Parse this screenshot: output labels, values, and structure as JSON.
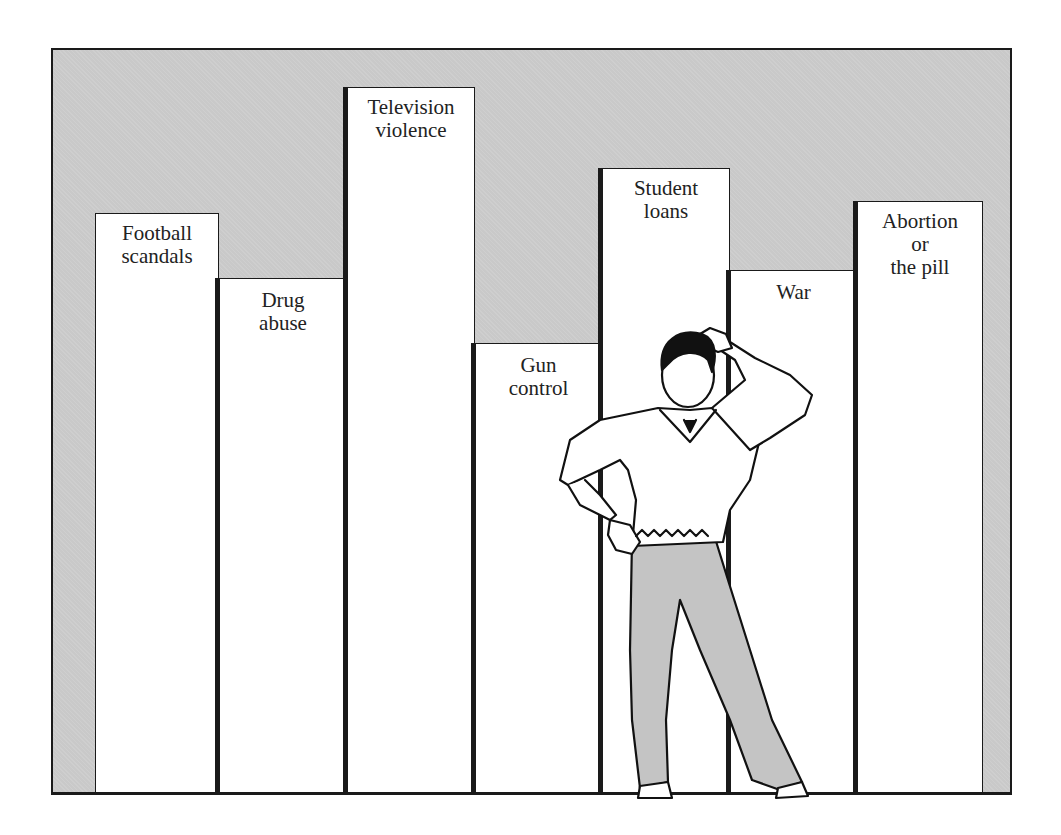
{
  "chart_data": {
    "type": "bar",
    "title": "",
    "xlabel": "",
    "ylabel": "",
    "grid": false,
    "legend": null,
    "categories": [
      "Football scandals",
      "Drug abuse",
      "Television violence",
      "Gun control",
      "Student loans",
      "War",
      "Abortion or the pill"
    ],
    "display_labels": [
      "Football\nscandals",
      "Drug\nabuse",
      "Television\nviolence",
      "Gun\ncontrol",
      "Student\nloans",
      "War",
      "Abortion\nor\nthe pill"
    ],
    "values": [
      581,
      516,
      707,
      451,
      626,
      524,
      593
    ],
    "value_units": "relative height (px above baseline, no axis shown)",
    "ylim": [
      0,
      746
    ],
    "bar_color": "#ffffff",
    "background_color": "#c9c9c9",
    "outline_color": "#1a1a1a",
    "annotations": [
      "Illustration of a puzzled man scratching his head standing in front of the 'Gun control', 'Student loans' and 'War' bars"
    ]
  },
  "illustration": {
    "subject": "puzzled-man",
    "pants_color": "#c4c4c4"
  }
}
